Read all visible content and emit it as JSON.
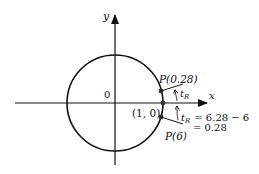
{
  "diagram": {
    "axes": {
      "x_label": "x",
      "y_label": "y",
      "origin_label": "0"
    },
    "circle": {
      "type": "unit-circle"
    },
    "points": {
      "p028": {
        "label": "P(0.28)"
      },
      "p10": {
        "label": "(1, 0)"
      },
      "p6": {
        "label": "P(6)"
      }
    },
    "annotations": {
      "tR_upper": "t",
      "tR_upper_sub": "R",
      "tR_lower": "t",
      "tR_lower_sub": "R",
      "equation_line1": "= 6.28 − 6",
      "equation_line2": "= 0.28"
    },
    "colors": {
      "stroke": "#111111",
      "point": "#333333"
    }
  }
}
